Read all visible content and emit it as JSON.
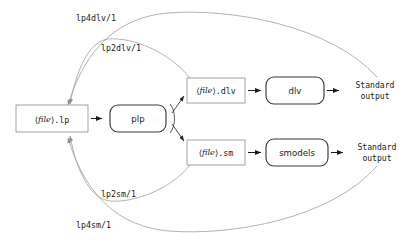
{
  "diagram": {
    "background_color": "#ffffff",
    "nodes": {
      "input_file": {
        "bracket_open": "⟨",
        "meta": "file",
        "bracket_close": "⟩",
        "suffix": ".lp",
        "shape": "rectangle",
        "border_color": "#8d8d8d"
      },
      "plp": {
        "label": "plp",
        "shape": "rounded",
        "border_color": "#3a3a3a"
      },
      "dlv_file": {
        "bracket_open": "⟨",
        "meta": "file",
        "bracket_close": "⟩",
        "suffix": ".dlv",
        "shape": "rectangle",
        "border_color": "#8d8d8d"
      },
      "sm_file": {
        "bracket_open": "⟨",
        "meta": "file",
        "bracket_close": "⟩",
        "suffix": ".sm",
        "shape": "rectangle",
        "border_color": "#8d8d8d"
      },
      "dlv_solver": {
        "label": "dlv",
        "shape": "rounded",
        "border_color": "#3a3a3a"
      },
      "smodels_solver": {
        "label": "smodels",
        "shape": "rounded",
        "border_color": "#3a3a3a"
      },
      "dlv_output": {
        "line1": "Standard",
        "line2": "output"
      },
      "smodels_output": {
        "line1": "Standard",
        "line2": "output"
      }
    },
    "edge_labels": {
      "lp4dlv": "lp4dlv/1",
      "lp2dlv": "lp2dlv/1",
      "lp2sm": "lp2sm/1",
      "lp4sm": "lp4sm/1"
    },
    "colors": {
      "curve": "#9a9a9a",
      "arrow": "#1a1a1a",
      "file_border": "#8d8d8d",
      "proc_border": "#3a3a3a",
      "text": "#1a1a1a"
    }
  }
}
